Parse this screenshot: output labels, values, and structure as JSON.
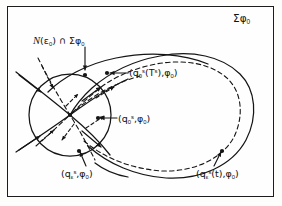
{
  "figure": {
    "domain": "dynamical-systems-phase-portrait",
    "background_color": "#fdfdfc",
    "frame_color": "#1c1c1c",
    "curve_color": "#151515",
    "labels": {
      "section_top_right": "Σφ",
      "section_top_right_sub": "0",
      "neighborhood_prefix": "(ε",
      "neighborhood_sub1": "0",
      "neighborhood_mid": ") ∩ Σφ",
      "neighborhood_sub2": "0",
      "neighborhood_script": "N",
      "q0_ts_open": "(q",
      "q0_ts_sub": "0",
      "q0_ts_sup": "s",
      "q0_ts_mid": "(T",
      "q0_ts_sup2": "s",
      "q0_ts_comma": "),φ",
      "q0_ts_sub2": "0",
      "q0_ts_close": ")",
      "q0_s_open": "(q",
      "q0_s_sub": "0",
      "q0_s_sup": "s",
      "q0_s_comma": ",φ",
      "q0_s_sub2": "0",
      "q0_s_close": ")",
      "qeps_s_open": "(q",
      "qeps_s_sub": "ε",
      "qeps_s_sup": "s",
      "qeps_s_comma": ",φ",
      "qeps_s_sub2": "0",
      "qeps_s_close": ")",
      "qeps_t_open": "(q",
      "qeps_t_sub": "ε",
      "qeps_t_sup": "s",
      "qeps_t_mid": "(t),φ",
      "qeps_t_sub2": "0",
      "qeps_t_close": ")"
    },
    "elements": {
      "neighborhood_circle": "circle-epsilon-neighborhood",
      "stable_manifold": "solid-stable-manifold-curve",
      "unstable_manifold": "dashed-unstable-manifold-curve",
      "homoclinic_loop_solid": "solid-homoclinic-loop",
      "homoclinic_loop_dashed": "dashed-homoclinic-loop",
      "intersection_points": 6,
      "flow_arrows": 12
    }
  }
}
